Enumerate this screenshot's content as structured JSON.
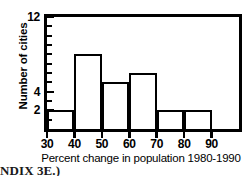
{
  "chart_data": {
    "type": "bar",
    "title": "",
    "subtitle": "",
    "xlabel": "Percent change in population 1980-1990",
    "ylabel": "Number of cities",
    "categories": [
      "30-40",
      "40-50",
      "50-60",
      "60-70",
      "70-80",
      "80-90"
    ],
    "bin_edges": [
      30,
      40,
      50,
      60,
      70,
      80,
      90
    ],
    "values": [
      2,
      8,
      5,
      6,
      2,
      2
    ],
    "xlim": [
      30,
      100
    ],
    "ylim": [
      0,
      12
    ],
    "xticks": [
      30,
      40,
      50,
      60,
      70,
      80,
      90
    ],
    "xtick_labels": [
      "30",
      "40",
      "50",
      "60",
      "70",
      "80",
      "90"
    ],
    "yticks": [
      1,
      2,
      3,
      4,
      5,
      6,
      7,
      8,
      9,
      10,
      11,
      12
    ],
    "ytick_labels_shown": [
      "12",
      "4",
      "2"
    ],
    "ytick_labeled_values": [
      12,
      4,
      2
    ],
    "grid": false,
    "legend": false,
    "bar_fill": "#ffffff",
    "bar_edge": "#000000",
    "frame_color": "#000000",
    "background": "#ffffff"
  },
  "axes": {
    "y_labels": [
      {
        "value": 12,
        "text": "12"
      },
      {
        "value": 4,
        "text": "4"
      },
      {
        "value": 2,
        "text": "2"
      }
    ],
    "x_labels": [
      {
        "value": 30,
        "text": "30"
      },
      {
        "value": 40,
        "text": "40"
      },
      {
        "value": 50,
        "text": "50"
      },
      {
        "value": 60,
        "text": "60"
      },
      {
        "value": 70,
        "text": "70"
      },
      {
        "value": 80,
        "text": "80"
      },
      {
        "value": 90,
        "text": "90"
      }
    ]
  },
  "caption": {
    "fragment": "NDIX 3E.)"
  }
}
